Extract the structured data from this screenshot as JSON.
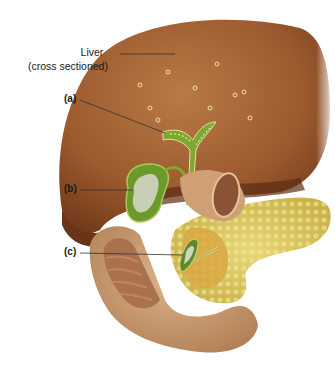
{
  "figure": {
    "labels": {
      "liver_line1": "Liver",
      "liver_line2": "(cross sectioned)",
      "a": "(a)",
      "b": "(b)",
      "c": "(c)"
    },
    "colors": {
      "liver": "#8b4a24",
      "liver_light": "#b0703f",
      "bile_duct": "#7fa832",
      "gallbladder": "#6c9a2a",
      "pancreas": "#d9c45a",
      "duodenum": "#c99a6c",
      "duodenum_inner": "#a9714d",
      "leader_line": "#333333"
    }
  }
}
